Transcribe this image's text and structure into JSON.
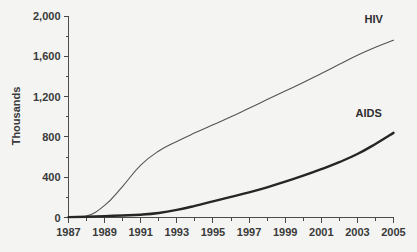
{
  "chart_data": {
    "type": "line",
    "title": "",
    "xlabel": "",
    "ylabel": "Thousands",
    "xlim": [
      1987,
      2005
    ],
    "ylim": [
      0,
      2000
    ],
    "grid": false,
    "legend_position": "inline-end-of-line",
    "y_ticks": [
      "0",
      "400",
      "800",
      "1,200",
      "1,600",
      "2,000"
    ],
    "y_tick_values": [
      0,
      400,
      800,
      1200,
      1600,
      2000
    ],
    "y_minor_tick_values": [
      200,
      600,
      1000,
      1400,
      1800
    ],
    "x_ticks": [
      "1987",
      "1989",
      "1991",
      "1993",
      "1995",
      "1997",
      "1999",
      "2001",
      "2003",
      "2005"
    ],
    "x_tick_values": [
      1987,
      1989,
      1991,
      1993,
      1995,
      1997,
      1999,
      2001,
      2003,
      2005
    ],
    "x_minor_tick_values": [
      1988,
      1990,
      1992,
      1994,
      1996,
      1998,
      2000,
      2002,
      2004
    ],
    "x": [
      1987,
      1988,
      1989,
      1990,
      1991,
      1992,
      1993,
      1994,
      1995,
      1996,
      1997,
      1998,
      1999,
      2000,
      2001,
      2002,
      2003,
      2004,
      2005
    ],
    "series": [
      {
        "name": "HIV",
        "color": "#545454",
        "line_width": 1,
        "label_x": 2003.4,
        "label_y": 1930,
        "values": [
          5,
          15,
          120,
          310,
          520,
          660,
          755,
          840,
          920,
          1000,
          1085,
          1170,
          1255,
          1340,
          1430,
          1520,
          1610,
          1690,
          1760
        ]
      },
      {
        "name": "AIDS",
        "color": "#262626",
        "line_width": 2,
        "label_x": 2002.9,
        "label_y": 1000,
        "values": [
          4,
          8,
          14,
          20,
          28,
          45,
          75,
          115,
          160,
          205,
          250,
          300,
          355,
          415,
          480,
          550,
          630,
          730,
          840
        ]
      }
    ]
  }
}
